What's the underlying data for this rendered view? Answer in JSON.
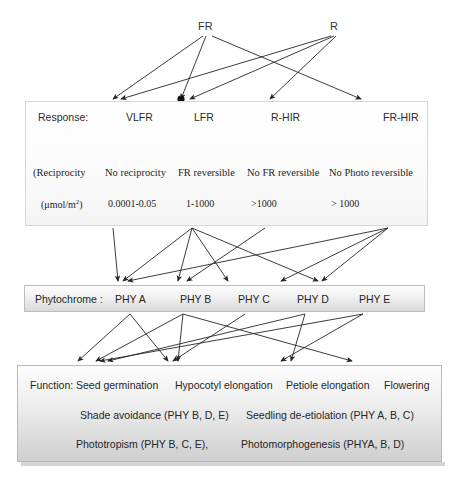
{
  "diagram": {
    "background": "#ffffff",
    "line_color": "#262626"
  },
  "light_sources": [
    {
      "id": "FR",
      "label": "FR",
      "x": 205,
      "y": 28
    },
    {
      "id": "R",
      "label": "R",
      "x": 334,
      "y": 28
    }
  ],
  "response_panel": {
    "row_label": "Response:",
    "responses": [
      {
        "label": "VLFR",
        "x": 100
      },
      {
        "label": "LFR",
        "x": 168
      },
      {
        "label": "R-HIR",
        "x": 245
      },
      {
        "label": "FR-HIR",
        "x": 357
      }
    ],
    "reciprocity_row": [
      {
        "label": "(Reciprocity",
        "x": 32
      },
      {
        "label": "No reciprocity",
        "x": 104
      },
      {
        "label": "FR reversible",
        "x": 177
      },
      {
        "label": "No FR reversible",
        "x": 246
      },
      {
        "label": "No Photo reversible",
        "x": 328
      }
    ],
    "fluence_row": [
      {
        "label": "(μmol/m",
        "sup": "2",
        "suffix": ")",
        "x": 40
      },
      {
        "label": "0.0001-0.05",
        "x": 107
      },
      {
        "label": "1-1000",
        "x": 185
      },
      {
        "label": ">1000",
        "x": 250
      },
      {
        "label": "> 1000",
        "x": 330
      }
    ]
  },
  "phytochrome_panel": {
    "row_label": "Phytochrome :",
    "items": [
      {
        "label": "PHY A",
        "x": 90
      },
      {
        "label": "PHY B",
        "x": 155
      },
      {
        "label": "PHY C",
        "x": 213
      },
      {
        "label": "PHY D",
        "x": 272
      },
      {
        "label": "PHY E",
        "x": 334
      }
    ]
  },
  "function_panel": {
    "row_label": "Function:",
    "functions": [
      {
        "label": "Seed germination",
        "x": 70
      },
      {
        "label": "Hypocotyl elongation",
        "x": 169
      },
      {
        "label": "Petiole elongation",
        "x": 280
      },
      {
        "label": "Flowering",
        "x": 378
      }
    ],
    "row2": [
      {
        "label": "Shade avoidance (PHY B, D, E)",
        "x": 74
      },
      {
        "label": "Seedling de-etiolation (PHY A, B, C)",
        "x": 240
      }
    ],
    "row3": [
      {
        "label": "Phototropism (PHY B, C, E),",
        "x": 70
      },
      {
        "label": "Photomorphogenesis (PHYA, B, D)",
        "x": 235
      }
    ]
  },
  "connections": {
    "light_to_response": [
      {
        "from": "FR",
        "to": "VLFR",
        "x1": 203,
        "y1": 36,
        "x2": 113,
        "y2": 99
      },
      {
        "from": "FR",
        "to": "LFR",
        "x1": 206,
        "y1": 36,
        "x2": 181,
        "y2": 99
      },
      {
        "from": "FR",
        "to": "FR-HIR",
        "x1": 212,
        "y1": 36,
        "x2": 361,
        "y2": 99
      },
      {
        "from": "R",
        "to": "VLFR",
        "x1": 331,
        "y1": 36,
        "x2": 121,
        "y2": 99
      },
      {
        "from": "R",
        "to": "LFR",
        "x1": 334,
        "y1": 36,
        "x2": 190,
        "y2": 99
      },
      {
        "from": "R",
        "to": "R-HIR",
        "x1": 336,
        "y1": 36,
        "x2": 270,
        "y2": 99
      }
    ],
    "response_to_reciprocity": [
      {
        "x1": 110,
        "y1": 127,
        "x2": 73,
        "y2": 160
      },
      {
        "x1": 173,
        "y1": 127,
        "x2": 118,
        "y2": 160
      },
      {
        "x1": 173,
        "y1": 127,
        "x2": 181,
        "y2": 160
      },
      {
        "x1": 252,
        "y1": 127,
        "x2": 155,
        "y2": 160
      },
      {
        "x1": 252,
        "y1": 127,
        "x2": 228,
        "y2": 160
      },
      {
        "x1": 366,
        "y1": 127,
        "x2": 340,
        "y2": 160
      },
      {
        "x1": 366,
        "y1": 127,
        "x2": 389,
        "y2": 160
      }
    ],
    "response_to_phytochrome": [
      {
        "x1": 113,
        "y1": 228,
        "x2": 118,
        "y2": 281
      },
      {
        "x1": 192,
        "y1": 228,
        "x2": 123,
        "y2": 281
      },
      {
        "x1": 192,
        "y1": 228,
        "x2": 178,
        "y2": 281
      },
      {
        "x1": 192,
        "y1": 228,
        "x2": 228,
        "y2": 281
      },
      {
        "x1": 192,
        "y1": 228,
        "x2": 318,
        "y2": 281
      },
      {
        "x1": 265,
        "y1": 228,
        "x2": 187,
        "y2": 281
      },
      {
        "x1": 388,
        "y1": 228,
        "x2": 128,
        "y2": 281
      },
      {
        "x1": 388,
        "y1": 228,
        "x2": 281,
        "y2": 281
      },
      {
        "x1": 388,
        "y1": 228,
        "x2": 322,
        "y2": 281
      }
    ],
    "phytochrome_to_function": [
      {
        "x1": 130,
        "y1": 314,
        "x2": 78,
        "y2": 361
      },
      {
        "x1": 130,
        "y1": 314,
        "x2": 168,
        "y2": 361
      },
      {
        "x1": 183,
        "y1": 314,
        "x2": 96,
        "y2": 361
      },
      {
        "x1": 183,
        "y1": 314,
        "x2": 178,
        "y2": 361
      },
      {
        "x1": 183,
        "y1": 314,
        "x2": 352,
        "y2": 361
      },
      {
        "x1": 245,
        "y1": 314,
        "x2": 173,
        "y2": 361
      },
      {
        "x1": 305,
        "y1": 314,
        "x2": 108,
        "y2": 361
      },
      {
        "x1": 305,
        "y1": 314,
        "x2": 291,
        "y2": 361
      },
      {
        "x1": 363,
        "y1": 314,
        "x2": 281,
        "y2": 361
      },
      {
        "x1": 363,
        "y1": 314,
        "x2": 100,
        "y2": 361
      }
    ]
  }
}
